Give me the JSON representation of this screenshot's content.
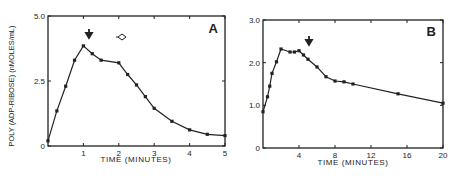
{
  "chart_data": [
    {
      "type": "line",
      "panel": "A",
      "title": "A",
      "xlabel": "TIME (MINUTES)",
      "ylabel": "POLY (ADP-RIBOSE) (nMOLES/mL)",
      "xlim": [
        0,
        5
      ],
      "ylim": [
        0,
        5.0
      ],
      "xticks": [
        "1",
        "2",
        "3",
        "4",
        "5"
      ],
      "yticks": [
        "0",
        "2.5",
        "5.0"
      ],
      "grid": false,
      "annotations": [
        {
          "type": "filled-arrow-down",
          "x": 1.15,
          "y": 4.4
        },
        {
          "type": "open-diamond-arrow",
          "x": 2.1,
          "y": 4.3
        }
      ],
      "x": [
        0,
        0.25,
        0.5,
        0.75,
        1.0,
        1.25,
        1.5,
        2.0,
        2.25,
        2.5,
        2.75,
        3.0,
        3.5,
        4.0,
        4.5,
        5.0
      ],
      "values": [
        0.2,
        1.35,
        2.3,
        3.3,
        3.85,
        3.55,
        3.3,
        3.2,
        2.75,
        2.35,
        1.9,
        1.45,
        0.95,
        0.62,
        0.45,
        0.4
      ]
    },
    {
      "type": "line",
      "panel": "B",
      "title": "B",
      "xlabel": "TIME (MINUTES)",
      "ylabel": "",
      "xlim": [
        0,
        20
      ],
      "ylim": [
        0,
        3.0
      ],
      "xticks": [
        "4",
        "8",
        "12",
        "16",
        "20"
      ],
      "yticks": [
        "0",
        "1.0",
        "2.0",
        "3.0"
      ],
      "grid": false,
      "annotations": [
        {
          "type": "filled-arrow-down",
          "x": 5.0,
          "y": 2.55
        }
      ],
      "x": [
        0,
        0.5,
        0.75,
        1.0,
        1.5,
        2.0,
        3.0,
        3.5,
        4.0,
        4.5,
        5.0,
        6.0,
        7.0,
        8.0,
        9.0,
        10.0,
        15.0,
        20.0
      ],
      "values": [
        0.85,
        1.2,
        1.45,
        1.75,
        2.02,
        2.32,
        2.25,
        2.25,
        2.28,
        2.18,
        2.08,
        1.9,
        1.67,
        1.57,
        1.55,
        1.5,
        1.27,
        1.05
      ]
    }
  ],
  "labels": {
    "panel_a": "A",
    "panel_b": "B",
    "ylabel": "POLY (ADP-RIBOSE) (nMOLES/mL)",
    "xlabel_a": "TIME (MINUTES)",
    "xlabel_b": "TIME (MINUTES)"
  }
}
